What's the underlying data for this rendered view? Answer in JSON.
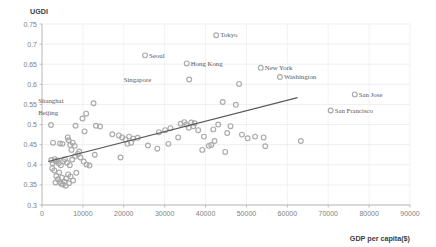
{
  "chart_data": {
    "type": "scatter",
    "title": "",
    "ylabel": "UGDI",
    "xlabel": "GDP per capita($)",
    "xlim": [
      0,
      90000
    ],
    "ylim": [
      0.3,
      0.75
    ],
    "grid": true,
    "legend": "none",
    "xticks": [
      0,
      10000,
      20000,
      30000,
      40000,
      50000,
      60000,
      70000,
      80000,
      90000
    ],
    "xtick_labels": [
      "0",
      "10000",
      "20000",
      "30000",
      "40000",
      "50000",
      "60000",
      "70000",
      "80000",
      "90000"
    ],
    "yticks": [
      0.3,
      0.35,
      0.4,
      0.45,
      0.5,
      0.55,
      0.6,
      0.65,
      0.7,
      0.75
    ],
    "ytick_labels": [
      "0.3",
      "0.35",
      "0.4",
      "0.45",
      "0.5",
      "0.55",
      "0.6",
      "0.65",
      "0.7",
      "0.75"
    ],
    "marker_color": "#a6a6a6",
    "trendline_color": "#595959",
    "trendline": {
      "x0": 1500,
      "y0": 0.408,
      "x1": 62500,
      "y1": 0.567
    },
    "annotations": [
      {
        "label": "Tokyo",
        "x": 42600,
        "y": 0.722,
        "dx": 4,
        "dy": 2.2
      },
      {
        "label": "Seoul",
        "x": 25200,
        "y": 0.672,
        "dx": 4,
        "dy": 2.2
      },
      {
        "label": "Hong Kong",
        "x": 35400,
        "y": 0.652,
        "dx": 4,
        "dy": 2.2
      },
      {
        "label": "Singapore",
        "x": 36000,
        "y": 0.612,
        "dx": -38,
        "dy": 2.2
      },
      {
        "label": "New York",
        "x": 53500,
        "y": 0.641,
        "dx": 4,
        "dy": 2.2
      },
      {
        "label": "Washington",
        "x": 58200,
        "y": 0.618,
        "dx": 4,
        "dy": 2.2
      },
      {
        "label": "San Jose",
        "x": 76500,
        "y": 0.575,
        "dx": 4,
        "dy": 2.2
      },
      {
        "label": "San Francisco",
        "x": 70600,
        "y": 0.535,
        "dx": 4,
        "dy": 2.2
      },
      {
        "label": "Shanghai",
        "x": 12600,
        "y": 0.553,
        "dx": -30,
        "dy": 0.0
      },
      {
        "label": "Beijing",
        "x": 10800,
        "y": 0.527,
        "dx": -28,
        "dy": 1.5
      }
    ],
    "points": [
      {
        "x": 42600,
        "y": 0.722
      },
      {
        "x": 25200,
        "y": 0.672
      },
      {
        "x": 35400,
        "y": 0.652
      },
      {
        "x": 36000,
        "y": 0.612
      },
      {
        "x": 53500,
        "y": 0.641
      },
      {
        "x": 58200,
        "y": 0.618
      },
      {
        "x": 76500,
        "y": 0.575
      },
      {
        "x": 70600,
        "y": 0.535
      },
      {
        "x": 12600,
        "y": 0.553
      },
      {
        "x": 10800,
        "y": 0.527
      },
      {
        "x": 48200,
        "y": 0.601
      },
      {
        "x": 44200,
        "y": 0.556
      },
      {
        "x": 47400,
        "y": 0.549
      },
      {
        "x": 2200,
        "y": 0.499
      },
      {
        "x": 9900,
        "y": 0.515
      },
      {
        "x": 8200,
        "y": 0.497
      },
      {
        "x": 13200,
        "y": 0.497
      },
      {
        "x": 14200,
        "y": 0.495
      },
      {
        "x": 10400,
        "y": 0.483
      },
      {
        "x": 2700,
        "y": 0.455
      },
      {
        "x": 4400,
        "y": 0.453
      },
      {
        "x": 5000,
        "y": 0.452
      },
      {
        "x": 6300,
        "y": 0.468
      },
      {
        "x": 6500,
        "y": 0.461
      },
      {
        "x": 6900,
        "y": 0.449
      },
      {
        "x": 7500,
        "y": 0.455
      },
      {
        "x": 8000,
        "y": 0.447
      },
      {
        "x": 7200,
        "y": 0.437
      },
      {
        "x": 17200,
        "y": 0.476
      },
      {
        "x": 18800,
        "y": 0.473
      },
      {
        "x": 19600,
        "y": 0.468
      },
      {
        "x": 20400,
        "y": 0.463
      },
      {
        "x": 21300,
        "y": 0.47
      },
      {
        "x": 22300,
        "y": 0.465
      },
      {
        "x": 23400,
        "y": 0.467
      },
      {
        "x": 21800,
        "y": 0.455
      },
      {
        "x": 20900,
        "y": 0.452
      },
      {
        "x": 28600,
        "y": 0.481
      },
      {
        "x": 30100,
        "y": 0.486
      },
      {
        "x": 31400,
        "y": 0.491
      },
      {
        "x": 33900,
        "y": 0.502
      },
      {
        "x": 34800,
        "y": 0.506
      },
      {
        "x": 35300,
        "y": 0.5
      },
      {
        "x": 36500,
        "y": 0.505
      },
      {
        "x": 37300,
        "y": 0.503
      },
      {
        "x": 37000,
        "y": 0.496
      },
      {
        "x": 35900,
        "y": 0.492
      },
      {
        "x": 38200,
        "y": 0.486
      },
      {
        "x": 39600,
        "y": 0.47
      },
      {
        "x": 40800,
        "y": 0.447
      },
      {
        "x": 39200,
        "y": 0.437
      },
      {
        "x": 41400,
        "y": 0.449
      },
      {
        "x": 33300,
        "y": 0.468
      },
      {
        "x": 19200,
        "y": 0.418
      },
      {
        "x": 2300,
        "y": 0.412
      },
      {
        "x": 2600,
        "y": 0.404
      },
      {
        "x": 3100,
        "y": 0.414
      },
      {
        "x": 3400,
        "y": 0.408
      },
      {
        "x": 3700,
        "y": 0.411
      },
      {
        "x": 4100,
        "y": 0.404
      },
      {
        "x": 4600,
        "y": 0.399
      },
      {
        "x": 5200,
        "y": 0.409
      },
      {
        "x": 5600,
        "y": 0.414
      },
      {
        "x": 6100,
        "y": 0.405
      },
      {
        "x": 6800,
        "y": 0.399
      },
      {
        "x": 7400,
        "y": 0.413
      },
      {
        "x": 8100,
        "y": 0.421
      },
      {
        "x": 8800,
        "y": 0.427
      },
      {
        "x": 9400,
        "y": 0.418
      },
      {
        "x": 10200,
        "y": 0.408
      },
      {
        "x": 10900,
        "y": 0.401
      },
      {
        "x": 11600,
        "y": 0.398
      },
      {
        "x": 12900,
        "y": 0.425
      },
      {
        "x": 9100,
        "y": 0.433
      },
      {
        "x": 8400,
        "y": 0.38
      },
      {
        "x": 2500,
        "y": 0.391
      },
      {
        "x": 3000,
        "y": 0.386
      },
      {
        "x": 3500,
        "y": 0.372
      },
      {
        "x": 3900,
        "y": 0.364
      },
      {
        "x": 4300,
        "y": 0.357
      },
      {
        "x": 4700,
        "y": 0.353
      },
      {
        "x": 5100,
        "y": 0.351
      },
      {
        "x": 5500,
        "y": 0.358
      },
      {
        "x": 5900,
        "y": 0.366
      },
      {
        "x": 6400,
        "y": 0.376
      },
      {
        "x": 7000,
        "y": 0.371
      },
      {
        "x": 7600,
        "y": 0.361
      },
      {
        "x": 4900,
        "y": 0.368
      },
      {
        "x": 4200,
        "y": 0.381
      },
      {
        "x": 3300,
        "y": 0.356
      },
      {
        "x": 5800,
        "y": 0.348
      },
      {
        "x": 6600,
        "y": 0.354
      },
      {
        "x": 45300,
        "y": 0.479
      },
      {
        "x": 43100,
        "y": 0.5
      },
      {
        "x": 46100,
        "y": 0.496
      },
      {
        "x": 48900,
        "y": 0.475
      },
      {
        "x": 50300,
        "y": 0.466
      },
      {
        "x": 52100,
        "y": 0.47
      },
      {
        "x": 54200,
        "y": 0.468
      },
      {
        "x": 54600,
        "y": 0.446
      },
      {
        "x": 63300,
        "y": 0.459
      },
      {
        "x": 44800,
        "y": 0.432
      },
      {
        "x": 42200,
        "y": 0.459
      },
      {
        "x": 41900,
        "y": 0.488
      },
      {
        "x": 30900,
        "y": 0.452
      },
      {
        "x": 28200,
        "y": 0.44
      },
      {
        "x": 25900,
        "y": 0.448
      }
    ]
  }
}
